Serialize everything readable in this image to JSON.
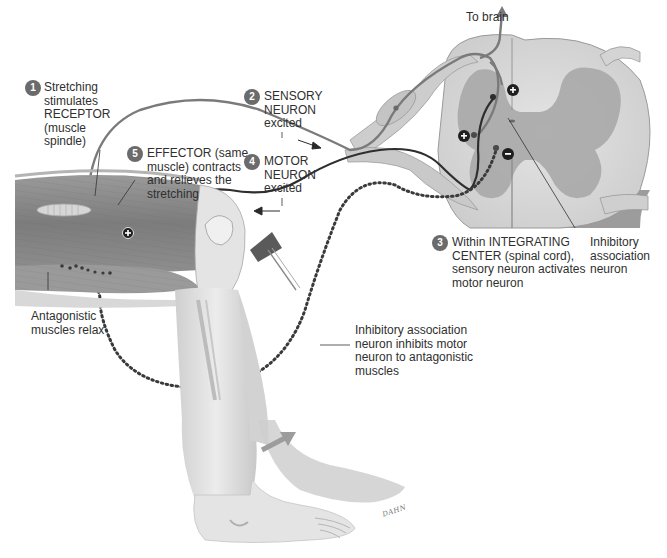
{
  "diagram": {
    "type": "stretch-reflex-arc",
    "colors": {
      "badge": "#6b6b6b",
      "sensory_neuron": "#7a7a7a",
      "motor_neuron": "#2e2e2e",
      "inhibitory_dotted": "#3a3a3a",
      "muscle": "#8a8a8a",
      "spinal_white_matter": "#d8d8d8",
      "spinal_gray_matter": "#a9a9a9",
      "skin": "#e2e2e2"
    },
    "labels": {
      "to_brain": "To brain",
      "step1": {
        "number": "1",
        "lines": [
          "Stretching",
          "stimulates",
          "RECEPTOR",
          "(muscle",
          "spindle)"
        ]
      },
      "step2": {
        "number": "2",
        "lines": [
          "SENSORY",
          "NEURON",
          "excited"
        ]
      },
      "step3": {
        "number": "3",
        "lines": [
          "Within INTEGRATING",
          "CENTER (spinal cord),",
          "sensory neuron activates",
          "motor neuron"
        ]
      },
      "step4": {
        "number": "4",
        "lines": [
          "MOTOR",
          "NEURON",
          "excited"
        ]
      },
      "step5": {
        "number": "5",
        "lines": [
          "EFFECTOR (same",
          "muscle) contracts",
          "and relieves the",
          "stretching"
        ]
      },
      "inhibitory_association": {
        "lines": [
          "Inhibitory",
          "association",
          "neuron"
        ]
      },
      "antagonistic_relax": {
        "lines": [
          "Antagonistic",
          "muscles relax"
        ]
      },
      "inhibitory_inhibits": {
        "lines": [
          "Inhibitory association",
          "neuron inhibits motor",
          "neuron to antagonistic",
          "muscles"
        ]
      }
    },
    "synapse_signs": {
      "excitatory": "+",
      "inhibitory": "−"
    },
    "signature": "DAHN"
  }
}
